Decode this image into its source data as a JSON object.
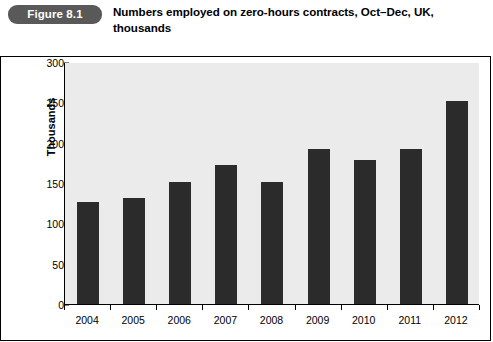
{
  "header": {
    "badge_label": "Figure 8.1",
    "title": "Numbers employed on zero-hours contracts, Oct–Dec, UK, thousands",
    "badge_color": "#595959",
    "badge_text_color": "#ffffff"
  },
  "chart_data": {
    "type": "bar",
    "title": "Numbers employed on zero-hours contracts, Oct–Dec, UK, thousands",
    "categories": [
      "2004",
      "2005",
      "2006",
      "2007",
      "2008",
      "2009",
      "2010",
      "2011",
      "2012"
    ],
    "values": [
      126,
      131,
      151,
      172,
      151,
      192,
      178,
      192,
      252
    ],
    "xlabel": "",
    "ylabel": "Thousands",
    "ylim": [
      0,
      300
    ],
    "ytick_step": 50,
    "yticks": [
      "300",
      "250",
      "200",
      "150",
      "100",
      "50",
      "0"
    ],
    "ytick_values": [
      300,
      250,
      200,
      150,
      100,
      50,
      0
    ],
    "grid": false,
    "legend": null,
    "bar_color": "#2b2b2b",
    "plot_background": "#ebebeb",
    "axis_color": "#000000"
  }
}
